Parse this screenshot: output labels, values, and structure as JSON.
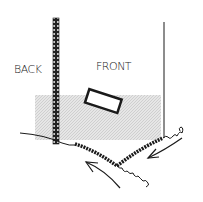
{
  "diagram": {
    "labels": {
      "back": "BACK",
      "front": "FRONT"
    },
    "colors": {
      "ink": "#1a1a1a",
      "shade": "#d9d9d9",
      "background": "#ffffff"
    }
  }
}
